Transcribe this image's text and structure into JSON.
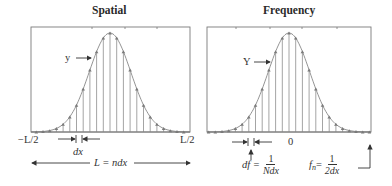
{
  "panels": [
    {
      "id": "spatial",
      "title": "Spatial",
      "signal_label": "y",
      "left_label": "−L/2",
      "right_label": "L/2",
      "spacing_label": "dx",
      "span_label": "L = ndx"
    },
    {
      "id": "frequency",
      "title": "Frequency",
      "signal_label": "Y",
      "center_label": "0",
      "df_label_lhs": "df =",
      "df_num": "1",
      "df_den": "Ndx",
      "fn_label_lhs": "f",
      "fn_sub": "n",
      "fn_eq": " =",
      "fn_num": "1",
      "fn_den": "2dx"
    }
  ],
  "colors": {
    "frame": "#7a7a7a",
    "stem": "#9a9a9a",
    "curve": "#888888",
    "marker": "#7a7a7a",
    "text": "#333333",
    "arrow": "#333333"
  },
  "chart_data": [
    {
      "type": "stem",
      "title": "Spatial",
      "xlabel": "",
      "ylabel": "y",
      "x_range_labels": [
        "−L/2",
        "L/2"
      ],
      "n_samples": 24,
      "x_index": [
        -12,
        -11,
        -10,
        -9,
        -8,
        -7,
        -6,
        -5,
        -4,
        -3,
        -2,
        -1,
        0,
        1,
        2,
        3,
        4,
        5,
        6,
        7,
        8,
        9,
        10,
        11
      ],
      "values": [
        0.0,
        0.0,
        0.01,
        0.02,
        0.04,
        0.08,
        0.14,
        0.24,
        0.37,
        0.53,
        0.7,
        0.86,
        0.97,
        0.97,
        0.86,
        0.7,
        0.53,
        0.37,
        0.24,
        0.14,
        0.08,
        0.04,
        0.02,
        0.01
      ],
      "envelope": "gaussian"
    },
    {
      "type": "stem",
      "title": "Frequency",
      "xlabel": "",
      "ylabel": "Y",
      "x_center_label": "0",
      "n_samples": 24,
      "x_index": [
        -12,
        -11,
        -10,
        -9,
        -8,
        -7,
        -6,
        -5,
        -4,
        -3,
        -2,
        -1,
        0,
        1,
        2,
        3,
        4,
        5,
        6,
        7,
        8,
        9,
        10,
        11
      ],
      "values": [
        0.0,
        0.0,
        0.01,
        0.02,
        0.04,
        0.08,
        0.14,
        0.24,
        0.37,
        0.53,
        0.7,
        0.86,
        0.97,
        0.97,
        0.86,
        0.7,
        0.53,
        0.37,
        0.24,
        0.14,
        0.08,
        0.04,
        0.02,
        0.01
      ],
      "envelope": "gaussian"
    }
  ]
}
